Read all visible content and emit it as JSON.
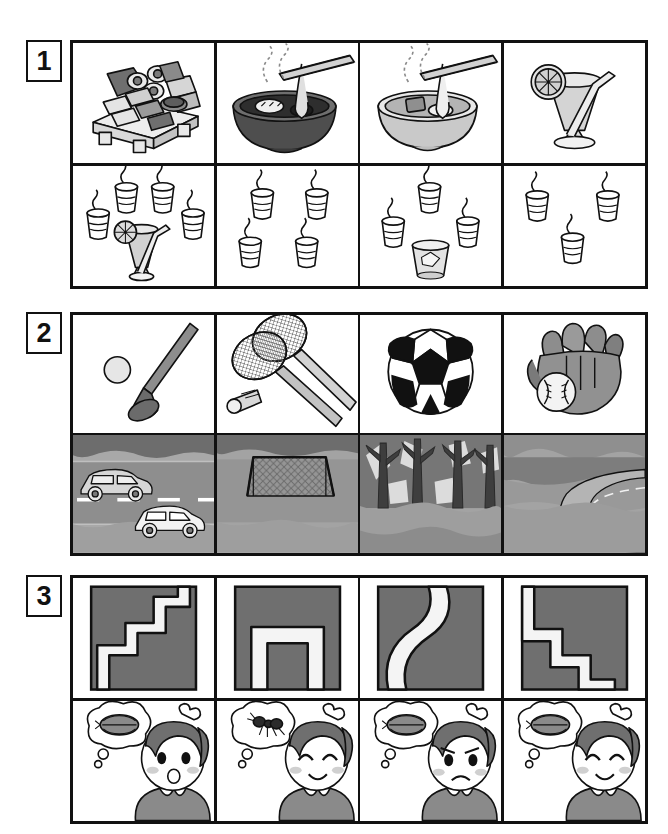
{
  "worksheet": {
    "title": "Picture matching worksheet",
    "sections": [
      {
        "number": "1",
        "theme": "food-and-drink",
        "top_row": [
          {
            "id": "sushi-platter",
            "label": "sushi platter on wooden board"
          },
          {
            "id": "ramen-bowl-dark",
            "label": "steaming noodle bowl with chopsticks"
          },
          {
            "id": "ramen-bowl-light",
            "label": "steaming noodle bowl with chopsticks"
          },
          {
            "id": "lemon-drink-glass",
            "label": "tall drink with lemon slice and straw"
          }
        ],
        "bottom_row": [
          {
            "id": "four-teacups-and-juice",
            "label": "four steaming teacups and a lemon drink",
            "teacup_count": "4",
            "extra": "lemon drink glass"
          },
          {
            "id": "four-teacups",
            "label": "four steaming teacups",
            "teacup_count": "4",
            "extra": ""
          },
          {
            "id": "three-teacups-and-tumbler",
            "label": "three steaming teacups and a water glass",
            "teacup_count": "3",
            "extra": "water tumbler"
          },
          {
            "id": "three-teacups",
            "label": "three steaming teacups",
            "teacup_count": "3",
            "extra": ""
          }
        ]
      },
      {
        "number": "2",
        "theme": "sports-and-places",
        "top_row": [
          {
            "id": "golf-club-and-ball",
            "label": "golf club with ball"
          },
          {
            "id": "badminton-rackets",
            "label": "two badminton rackets and shuttlecock"
          },
          {
            "id": "soccer-ball",
            "label": "soccer ball"
          },
          {
            "id": "baseball-glove",
            "label": "baseball glove with ball"
          }
        ],
        "bottom_row": [
          {
            "id": "road-with-cars",
            "label": "road with two cars"
          },
          {
            "id": "soccer-goal-field",
            "label": "field with soccer goal net"
          },
          {
            "id": "forest-trees",
            "label": "forest with bare trees"
          },
          {
            "id": "winding-road-hills",
            "label": "winding road through hills"
          }
        ]
      },
      {
        "number": "3",
        "theme": "paths-and-feelings",
        "top_row": [
          {
            "id": "path-zigzag-up",
            "label": "zigzag staircase path ascending"
          },
          {
            "id": "path-inverted-u",
            "label": "inverted U shaped path"
          },
          {
            "id": "path-s-curve",
            "label": "S curved path"
          },
          {
            "id": "path-zigzag-down",
            "label": "zigzag staircase path descending"
          }
        ],
        "bottom_row": [
          {
            "id": "girl-surprised-pillbug",
            "label": "girl with surprised face thinking of pill bug",
            "bubble": "pill-bug",
            "expression": "surprised"
          },
          {
            "id": "girl-happy-ant",
            "label": "girl with happy face thinking of ant",
            "bubble": "ant",
            "expression": "happy"
          },
          {
            "id": "girl-sad-pillbug",
            "label": "girl with sad face thinking of pill bug",
            "bubble": "pill-bug",
            "expression": "sad"
          },
          {
            "id": "girl-smiling-pillbug",
            "label": "girl with smiling face thinking of pill bug",
            "bubble": "pill-bug",
            "expression": "smiling"
          }
        ]
      }
    ]
  },
  "colors": {
    "ink": "#111111",
    "paper": "#ffffff",
    "gray_dark": "#6f6f6f",
    "gray_mid": "#9a9a9a",
    "gray_light": "#c6c6c6",
    "gray_pale": "#e2e2e2"
  }
}
